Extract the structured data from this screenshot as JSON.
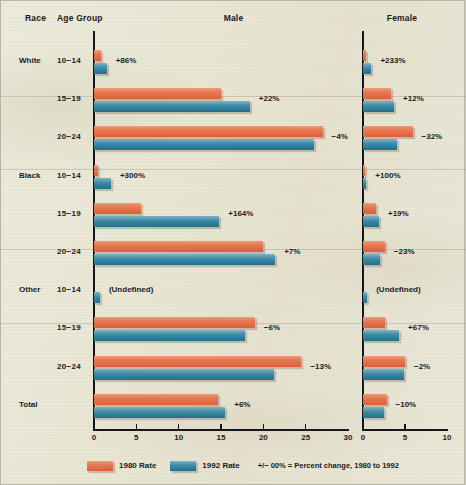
{
  "headers": {
    "race": "Race",
    "age_group": "Age Group",
    "male": "Male",
    "female": "Female"
  },
  "legend": {
    "rate_1980": "1980 Rate",
    "rate_1992": "1992 Rate",
    "note": "+/− 00% = Percent change, 1980 to 1992"
  },
  "colors": {
    "rate_1980": "#e67852",
    "rate_1992": "#3f8ba6",
    "paper": "#eae7d8",
    "axis": "#14161a",
    "text": "#1b1b1b"
  },
  "chart_data": {
    "type": "bar",
    "title": "",
    "orientation": "horizontal",
    "grid": false,
    "legend_position": "bottom",
    "panels": [
      {
        "name": "Male",
        "xlabel": "",
        "xlim": [
          0,
          30
        ],
        "xticks": [
          0,
          5,
          10,
          15,
          20,
          25,
          30
        ],
        "xticklabels": [
          "0",
          "5",
          "10",
          "15",
          "20",
          "25",
          "30"
        ]
      },
      {
        "name": "Female",
        "xlabel": "",
        "xlim": [
          0,
          10
        ],
        "xticks": [
          0,
          5,
          10
        ],
        "xticklabels": [
          "0",
          "5",
          "10"
        ]
      }
    ],
    "series": [
      {
        "name": "1980 Rate",
        "color": "#e67852"
      },
      {
        "name": "1992 Rate",
        "color": "#3f8ba6"
      }
    ],
    "rows": [
      {
        "race": "White",
        "age_group": "10−14",
        "male": {
          "rate_1980": 0.8,
          "rate_1992": 1.5,
          "change": "+86%"
        },
        "female": {
          "rate_1980": 0.3,
          "rate_1992": 1.0,
          "change": "+233%"
        }
      },
      {
        "race": "",
        "age_group": "15−19",
        "male": {
          "rate_1980": 15.0,
          "rate_1992": 18.4,
          "change": "+22%"
        },
        "female": {
          "rate_1980": 3.3,
          "rate_1992": 3.7,
          "change": "+12%"
        }
      },
      {
        "race": "",
        "age_group": "20−24",
        "male": {
          "rate_1980": 27.0,
          "rate_1992": 26.0,
          "change": "−4%"
        },
        "female": {
          "rate_1980": 5.9,
          "rate_1992": 4.0,
          "change": "−32%"
        }
      },
      {
        "race": "Black",
        "age_group": "10−14",
        "male": {
          "rate_1980": 0.5,
          "rate_1992": 2.0,
          "change": "+300%"
        },
        "female": {
          "rate_1980": 0.2,
          "rate_1992": 0.4,
          "change": "+100%"
        }
      },
      {
        "race": "",
        "age_group": "15−19",
        "male": {
          "rate_1980": 5.6,
          "rate_1992": 14.8,
          "change": "+164%"
        },
        "female": {
          "rate_1980": 1.6,
          "rate_1992": 1.9,
          "change": "+19%"
        }
      },
      {
        "race": "",
        "age_group": "20−24",
        "male": {
          "rate_1980": 20.0,
          "rate_1992": 21.4,
          "change": "+7%"
        },
        "female": {
          "rate_1980": 2.6,
          "rate_1992": 2.0,
          "change": "−23%"
        }
      },
      {
        "race": "Other",
        "age_group": "10−14",
        "male": {
          "rate_1980": 0.0,
          "rate_1992": 0.7,
          "change": "(Undefined)"
        },
        "female": {
          "rate_1980": 0.0,
          "rate_1992": 0.5,
          "change": "(Undefined)"
        }
      },
      {
        "race": "",
        "age_group": "15−19",
        "male": {
          "rate_1980": 19.0,
          "rate_1992": 17.8,
          "change": "−6%"
        },
        "female": {
          "rate_1980": 2.6,
          "rate_1992": 4.3,
          "change": "+67%"
        }
      },
      {
        "race": "",
        "age_group": "20−24",
        "male": {
          "rate_1980": 24.5,
          "rate_1992": 21.3,
          "change": "−13%"
        },
        "female": {
          "rate_1980": 5.0,
          "rate_1992": 4.9,
          "change": "−2%"
        }
      },
      {
        "race": "Total",
        "age_group": "",
        "male": {
          "rate_1980": 14.6,
          "rate_1992": 15.5,
          "change": "+6%"
        },
        "female": {
          "rate_1980": 2.8,
          "rate_1992": 2.5,
          "change": "−10%"
        }
      }
    ]
  }
}
